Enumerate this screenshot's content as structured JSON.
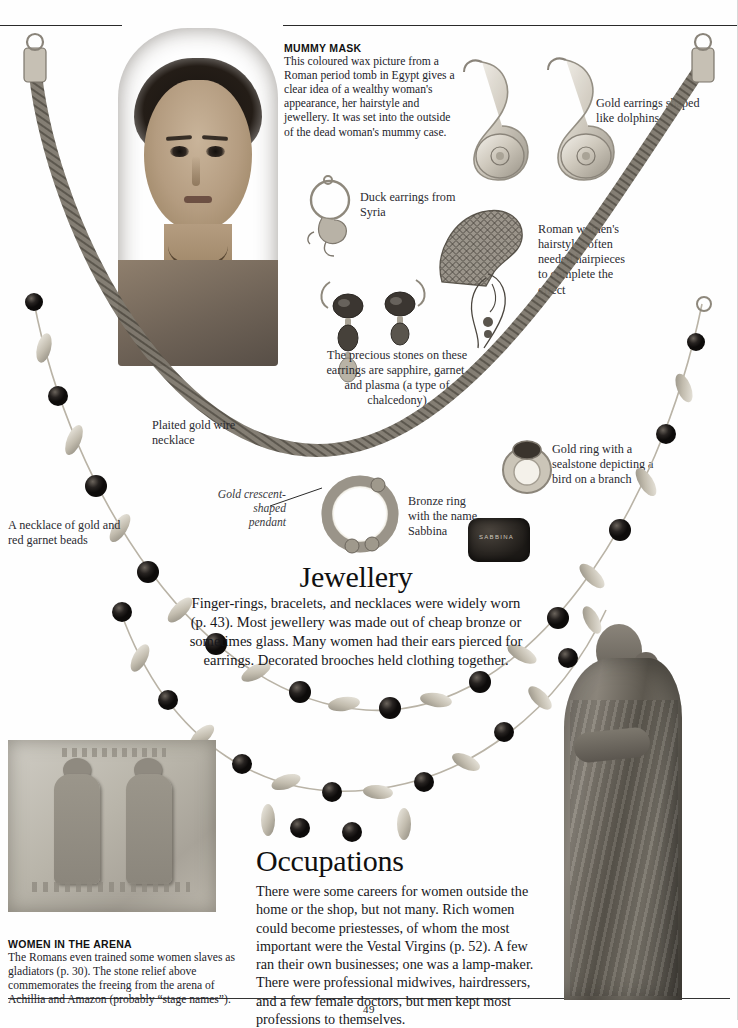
{
  "page": {
    "folio": "49",
    "background_color": "#fefefe",
    "ink_color": "#1a1a1a"
  },
  "captions": {
    "mummy_mask": {
      "heading": "MUMMY MASK",
      "body": "This coloured wax picture from a Roman period tomb in Egypt gives a clear idea of a wealthy woman's appearance,  her hairstyle and jewellery. It was set into the outside of the dead woman's mummy case."
    },
    "women_in_arena": {
      "heading": "WOMEN IN THE ARENA",
      "body": "The Romans even trained some women slaves as gladiators (p. 30). The stone relief above commemorates the freeing from the arena of Achillia and Amazon (probably “stage names”)."
    }
  },
  "labels": {
    "dolphin_earrings": "Gold earrings shaped like dolphins",
    "duck_earrings": "Duck earrings from Syria",
    "hairpieces": "Roman women's hairstyles often needed hairpieces to complete the effect",
    "precious_stones": "The precious stones on these earrings are sapphire, garnet, and plasma (a type of chalcedony)",
    "plaited_necklace": "Plaited gold wire necklace",
    "garnet_necklace": "A necklace of gold and red garnet beads",
    "crescent_pendant": "Gold crescent-shaped pendant",
    "bronze_ring": "Bronze ring with the name Sabbina",
    "gold_ring": "Gold ring with a sealstone depicting a bird on a branch"
  },
  "sections": [
    {
      "id": "jewellery",
      "title": "Jewellery",
      "body": "Finger-rings, bracelets, and necklaces were widely worn (p. 43). Most jewellery was made out of cheap bronze or sometimes glass. Many women had their ears pierced for earrings. Decorated brooches held clothing together."
    },
    {
      "id": "occupations",
      "title": "Occupations",
      "body": "There were some careers for women outside the home or the shop, but not many. Rich women could become priestesses, of whom the most important were the Vestal Virgins (p. 52). A few ran their own businesses; one was a lamp-maker. There were professional midwives, hairdressers, and a few female doctors, but men kept most professions to themselves."
    }
  ],
  "artifacts": {
    "ring_inscription": "SABBINA"
  }
}
